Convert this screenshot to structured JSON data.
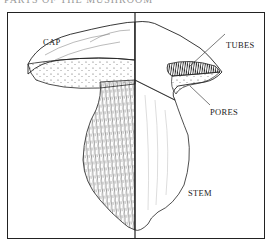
{
  "title": "PARTS OF THE MUSHROOM",
  "labels": {
    "cap": "CAP",
    "tubes": "TUBES",
    "pores": "PORES",
    "stem": "STEM"
  },
  "colors": {
    "ink": "#222222",
    "background": "#ffffff"
  }
}
